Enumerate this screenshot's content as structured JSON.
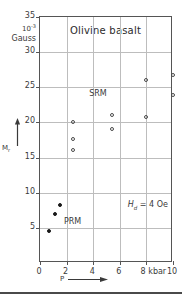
{
  "chart_data": {
    "type": "scatter",
    "title": "Olivine basalt",
    "xlabel": "P",
    "ylabel": "M_r",
    "unit_exponent": "10",
    "unit_exponent_sup": "-3",
    "unit_name": "Gauss",
    "xlim": [
      0,
      10
    ],
    "ylim": [
      0,
      35
    ],
    "x_ticks": [
      0,
      2,
      4,
      6,
      8,
      10
    ],
    "x_tick_labels": [
      "0",
      "2",
      "4",
      "6",
      "8 kbar",
      "10"
    ],
    "y_ticks": [
      5,
      10,
      15,
      20,
      25,
      30,
      35
    ],
    "y_tick_labels": [
      "5",
      "10",
      "15",
      "20",
      "25",
      "30",
      "35"
    ],
    "x_unit": "kbar",
    "grid": true,
    "legend_position": "in-plot-labels",
    "annotations": [
      {
        "text": "SRM",
        "x": 3.7,
        "y": 24.0
      },
      {
        "text": "PRM",
        "x": 1.8,
        "y": 5.8
      },
      {
        "text": "H_d = 4 Oe",
        "x": 6.6,
        "y": 8.2
      }
    ],
    "series": [
      {
        "name": "SRM",
        "marker": "open-circle",
        "points": [
          {
            "x": 2.45,
            "y": 20.0
          },
          {
            "x": 2.45,
            "y": 17.7
          },
          {
            "x": 2.45,
            "y": 16.1
          },
          {
            "x": 5.45,
            "y": 21.0
          },
          {
            "x": 5.45,
            "y": 19.1
          },
          {
            "x": 7.95,
            "y": 26.0
          },
          {
            "x": 7.95,
            "y": 20.8
          },
          {
            "x": 10.0,
            "y": 26.7
          },
          {
            "x": 10.0,
            "y": 23.9
          }
        ]
      },
      {
        "name": "PRM",
        "marker": "filled-circle",
        "points": [
          {
            "x": 0.68,
            "y": 4.6
          },
          {
            "x": 1.15,
            "y": 7.0
          },
          {
            "x": 1.52,
            "y": 8.2
          }
        ]
      }
    ]
  },
  "axis": {
    "y_unit_exp_base": "10",
    "y_unit_exp_power": "-3",
    "y_unit_label": "Gauss",
    "y_title_main": "M",
    "y_title_sub": "r",
    "x_title": "P"
  },
  "labels": {
    "title": "Olivine basalt",
    "srm": "SRM",
    "prm": "PRM",
    "field_main": "H",
    "field_sub": "d",
    "field_value": "= 4 Oe"
  },
  "colors": {
    "frame": "#555555",
    "grid": "#bdbdbd",
    "marker_open": "#4a4a4a",
    "marker_filled": "#1a1a1a",
    "text": "#3a3a3a",
    "background": "#ffffff"
  }
}
